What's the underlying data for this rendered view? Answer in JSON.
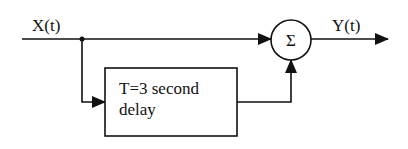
{
  "diagram": {
    "input_label": "X(t)",
    "output_label": "Y(t)",
    "summer_symbol": "Σ",
    "delay_block": {
      "line1": "T=3 second",
      "line2": "delay"
    },
    "colors": {
      "stroke": "#111111",
      "background": "#ffffff"
    }
  }
}
